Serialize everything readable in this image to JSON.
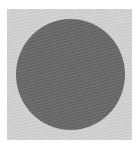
{
  "image": {
    "background_color": "#ffffff",
    "panel": {
      "shape": "square",
      "color": "#d3d3d3"
    },
    "circle": {
      "shape": "circle",
      "color": "#6b6b6b",
      "texture": "subtle wavy lines"
    }
  }
}
